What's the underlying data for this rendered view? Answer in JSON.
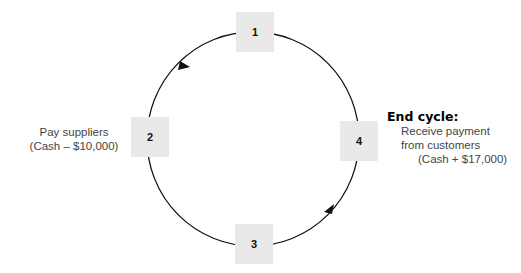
{
  "diagram": {
    "type": "cycle",
    "nodes": [
      {
        "id": "1",
        "label": "1"
      },
      {
        "id": "2",
        "label": "2"
      },
      {
        "id": "3",
        "label": "3"
      },
      {
        "id": "4",
        "label": "4"
      }
    ],
    "annotations": {
      "pay_suppliers": {
        "line1": "Pay suppliers",
        "line2": "(Cash – $10,000)"
      },
      "end_cycle": {
        "title": "End cycle:",
        "line1": "Receive payment",
        "line2": "from customers",
        "line3": "(Cash + $17,000)"
      }
    },
    "colors": {
      "box_fill": "#e9e9e9",
      "line": "#111111"
    }
  }
}
